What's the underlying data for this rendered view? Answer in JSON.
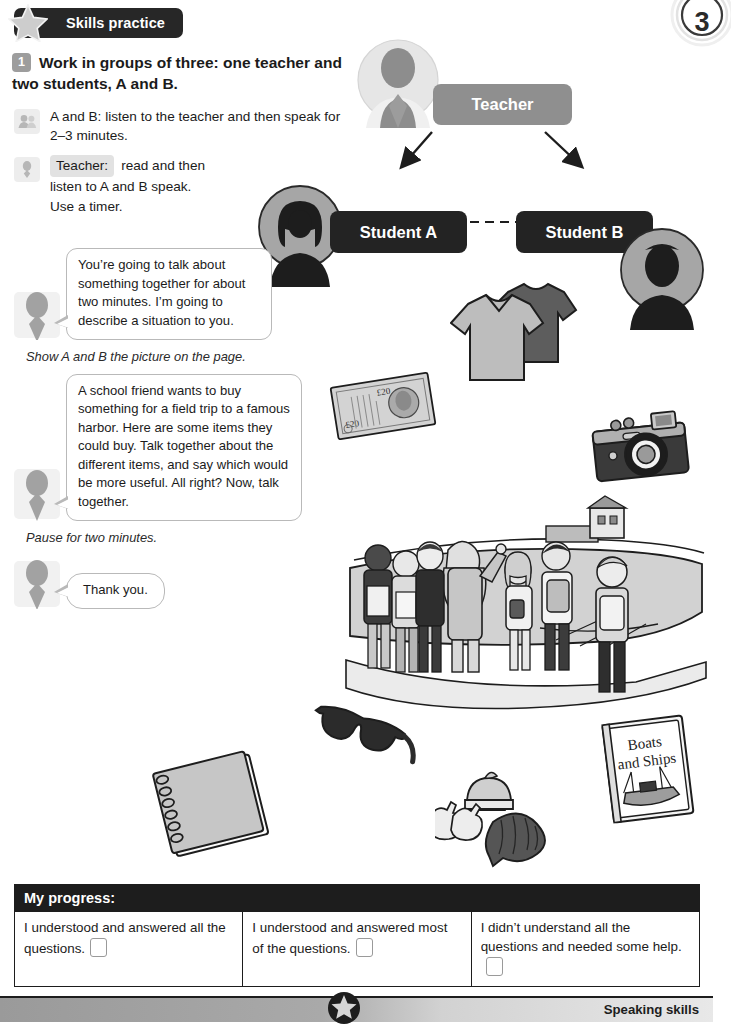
{
  "banner": {
    "title": "Skills practice",
    "star_icon": "star-icon"
  },
  "page_number": "3",
  "task": {
    "number": "1",
    "heading": "Work in groups of three: one teacher and two students, A and B.",
    "notes": [
      {
        "icon": "two-people-icon",
        "text": "A and B: listen to the teacher and then speak for 2–3 minutes."
      }
    ],
    "teacher_note": {
      "icon": "person-icon",
      "tag": "Teacher:",
      "line1": "read and then",
      "line2": "listen to A and B speak.",
      "line3": "Use a timer."
    }
  },
  "script": {
    "bubble1": "You’re going to talk about something together for about two minutes. I’m going to describe a situation to you.",
    "stage1": "Show A and B the picture on the page.",
    "bubble2": "A school friend wants to buy something for a field trip to a famous harbor. Here are some items they could buy. Talk together about the different items, and say which would be more useful. All right? Now, talk together.",
    "stage2": "Pause for two minutes.",
    "bubble3": "Thank you."
  },
  "diagram": {
    "teacher_label": "Teacher",
    "student_a_label": "Student A",
    "student_b_label": "Student B",
    "teacher_avatar": "teacher-avatar-icon",
    "student_a_avatar": "student-a-avatar-icon",
    "student_b_avatar": "student-b-avatar-icon",
    "arrow_to_a": "arrow-down-left-icon",
    "arrow_to_b": "arrow-down-right-icon",
    "arrow_between": "double-arrow-icon"
  },
  "illustration": {
    "banknote": {
      "name": "banknote-twenty-pounds",
      "denomination": "£20"
    },
    "tshirts": {
      "name": "two-tshirts"
    },
    "camera": {
      "name": "camera"
    },
    "harbor_scene": {
      "name": "school-group-at-harbor"
    },
    "notebook": {
      "name": "spiral-notebook"
    },
    "sunglasses": {
      "name": "sunglasses"
    },
    "winter_set": {
      "name": "hat-gloves-scarf"
    },
    "book": {
      "name": "book-boats-and-ships",
      "title_line1": "Boats",
      "title_line2": "and Ships"
    }
  },
  "progress": {
    "title": "My progress:",
    "options": [
      "I understood and answered all the questions.",
      "I understood and answered most of the questions.",
      "I didn’t understand all the questions and needed some help."
    ]
  },
  "footer": {
    "skill": "Speaking skills",
    "star_icon": "star-icon"
  },
  "colors": {
    "ink": "#1d1d1d",
    "banner_bg": "#272727",
    "teacher_pill": "#8f8f8f",
    "student_pill": "#232323",
    "chip_gray": "#9d9d9d",
    "bubble_border": "#b9b9b9"
  }
}
